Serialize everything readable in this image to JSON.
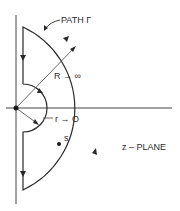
{
  "diagram": {
    "path_label": "PATH Γ",
    "big_radius_label": "R → ∞",
    "small_radius_label": "r → O",
    "point_label": "s",
    "plane_label": "z – PLANE",
    "colors": {
      "line": "#2a2a2a",
      "background": "#ffffff"
    }
  }
}
